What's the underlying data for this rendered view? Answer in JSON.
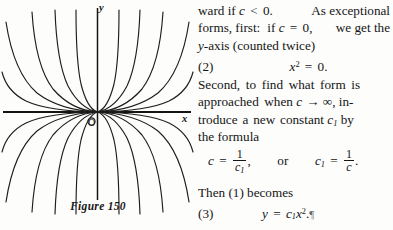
{
  "figure": {
    "caption": "Figure 150",
    "axis_labels": {
      "y": "y",
      "x": "x",
      "origin": "O"
    },
    "ink_color": "#141414",
    "background_color": "#fdfdfc",
    "curve_coefficients": [
      0.06,
      0.14,
      0.32,
      0.85,
      2.6,
      -0.06,
      -0.14,
      -0.32,
      -0.85,
      -2.6
    ]
  },
  "text": {
    "line1_a": "ward if",
    "line1_c": "c",
    "line1_lt": "<",
    "line1_zero": "0.",
    "line1_b": "As exceptional",
    "line2_a": "forms, first",
    "line2_colon": ":",
    "line2_if": "if",
    "line2_c": "c",
    "line2_eq": "=",
    "line2_zero": "0,",
    "line2_b": "we get the",
    "line3_y": "y",
    "line3_rest": "-axis (counted twice)",
    "eq2_tag": "(2)",
    "eq2_lhs": "x",
    "eq2_sup": "2",
    "eq2_eq": "=",
    "eq2_rhs": "0.",
    "line4": "Second, to find what form is",
    "line5_a": "approached when",
    "line5_c": "c",
    "line5_arrow": "→",
    "line5_inf": "∞",
    "line5_b": ", in-",
    "line6_a": "troduce a new constant",
    "line6_c": "c",
    "line6_sub": "1",
    "line6_b": "by",
    "line7": "the formula",
    "eqf_c": "c",
    "eqf_eq1": "=",
    "eqf_num1": "1",
    "eqf_den1": "c",
    "eqf_den1sub": "1",
    "eqf_comma": ",",
    "eqf_or": "or",
    "eqf_c1": "c",
    "eqf_c1sub": "1",
    "eqf_eq2": "=",
    "eqf_num2": "1",
    "eqf_den2": "c",
    "eqf_period": ".",
    "line8": "Then (1) becomes",
    "eq3_tag": "(3)",
    "eq3_y": "y",
    "eq3_eq": "=",
    "eq3_c": "c",
    "eq3_csub": "1",
    "eq3_x": "x",
    "eq3_sup": "2",
    "eq3_period": ".",
    "eq3_mark": "¶"
  }
}
